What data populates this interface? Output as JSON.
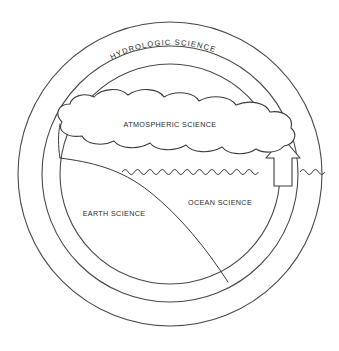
{
  "diagram": {
    "title_visible": false,
    "background_color": "#ffffff",
    "stroke_color": "#3a3a3a",
    "text_color": "#2b2b2b",
    "labels": {
      "outer_ring": "HYDROLOGIC   SCIENCE",
      "cloud": "ATMOSPHERIC SCIENCE",
      "land": "EARTH SCIENCE",
      "ocean": "OCEAN SCIENCE"
    },
    "elements": {
      "outer_circle_name": "outer-circle",
      "middle_circle_name": "middle-circle",
      "inner_circle_name": "inner-circle",
      "cloud_name": "cloud-shape",
      "ocean_surface_name": "ocean-wave-line",
      "land_name": "land-slope",
      "arrow_name": "evaporation-arrow"
    },
    "geometry": {
      "center_x": 170,
      "center_y": 174,
      "outer_radius": 152,
      "middle_radius": 128,
      "inner_radius": 110,
      "ocean_surface_y": 172
    }
  }
}
